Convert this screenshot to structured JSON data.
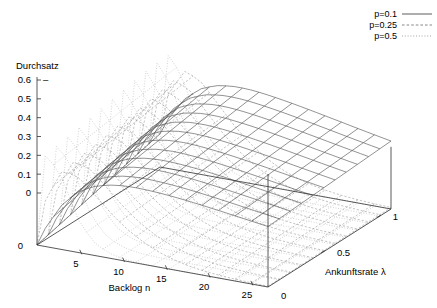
{
  "chart_data": {
    "type": "line",
    "render": "3d-surface-mesh",
    "title": "",
    "subtitle": "",
    "xlabel": "Backlog n",
    "ylabel": "Ankunftsrate λ",
    "zlabel": "Durchsatz",
    "xlim": [
      0,
      27
    ],
    "ylim": [
      0,
      1.1
    ],
    "zlim": [
      0,
      0.6
    ],
    "xticks": [
      5,
      10,
      15,
      20,
      25
    ],
    "xtick_labels": [
      "5",
      "10",
      "15",
      "20",
      "25"
    ],
    "yticks": [
      0,
      0.5,
      1
    ],
    "ytick_labels": [
      "0",
      "0.5",
      "1"
    ],
    "zticks": [
      0,
      0.1,
      0.2,
      0.3,
      0.4,
      0.5,
      0.6
    ],
    "ztick_labels": [
      "0",
      "0.1",
      "0.2",
      "0.3",
      "0.4",
      "0.5",
      "0.6"
    ],
    "grid": true,
    "legend_position": "top-right",
    "origin_label": "0",
    "legend": [
      {
        "label": "p=0.1",
        "style": "solid",
        "p": 0.1,
        "color": "#4a4a4a"
      },
      {
        "label": "p=0.25",
        "style": "dashed",
        "p": 0.25,
        "color": "#9a9a9a"
      },
      {
        "label": "p=0.5",
        "style": "dotted",
        "p": 0.5,
        "color": "#b0b0b0"
      }
    ],
    "series": [
      {
        "name": "p=0.1",
        "style": "solid",
        "p": 0.1,
        "n_values": [
          1,
          3,
          5,
          7,
          9,
          11,
          13,
          15,
          17,
          19,
          21,
          23,
          25,
          27
        ],
        "lambda_values": [
          0,
          0.1,
          0.2,
          0.3,
          0.4,
          0.5,
          0.6,
          0.7,
          0.8,
          0.9,
          1.0
        ],
        "z_by_n": [
          0.1,
          0.243,
          0.328,
          0.372,
          0.393,
          0.4,
          0.398,
          0.392,
          0.383,
          0.372,
          0.36,
          0.347,
          0.334,
          0.321
        ]
      },
      {
        "name": "p=0.25",
        "style": "dashed",
        "p": 0.25,
        "n_values": [
          1,
          3,
          5,
          7,
          9,
          11,
          13,
          15,
          17,
          19,
          21,
          23,
          25,
          27
        ],
        "lambda_values": [
          0,
          0.1,
          0.2,
          0.3,
          0.4,
          0.5,
          0.6,
          0.7,
          0.8,
          0.9,
          1.0
        ],
        "z_by_n": [
          0.25,
          0.422,
          0.396,
          0.311,
          0.225,
          0.156,
          0.104,
          0.067,
          0.042,
          0.026,
          0.016,
          0.01,
          0.006,
          0.004
        ]
      },
      {
        "name": "p=0.5",
        "style": "dotted",
        "p": 0.5,
        "n_values": [
          1,
          3,
          5,
          7,
          9,
          11,
          13,
          15,
          17,
          19,
          21,
          23,
          25,
          27
        ],
        "lambda_values": [
          0,
          0.1,
          0.2,
          0.3,
          0.4,
          0.5,
          0.6,
          0.7,
          0.8,
          0.9,
          1.0
        ],
        "z_by_n": [
          0.5,
          0.375,
          0.156,
          0.055,
          0.018,
          0.005,
          0.002,
          0.0005,
          0.0002,
          0.0001,
          0.0,
          0.0,
          0.0,
          0.0
        ]
      }
    ]
  },
  "axes": {
    "z_axis_title": "Durchsatz",
    "x_axis_title": "Backlog n",
    "y_axis_title": "Ankunftsrate λ",
    "z_origin_label": "0",
    "y_origin_label": "0"
  },
  "legend": {
    "entries": [
      {
        "label": "p=0.1"
      },
      {
        "label": "p=0.25"
      },
      {
        "label": "p=0.5"
      }
    ]
  }
}
